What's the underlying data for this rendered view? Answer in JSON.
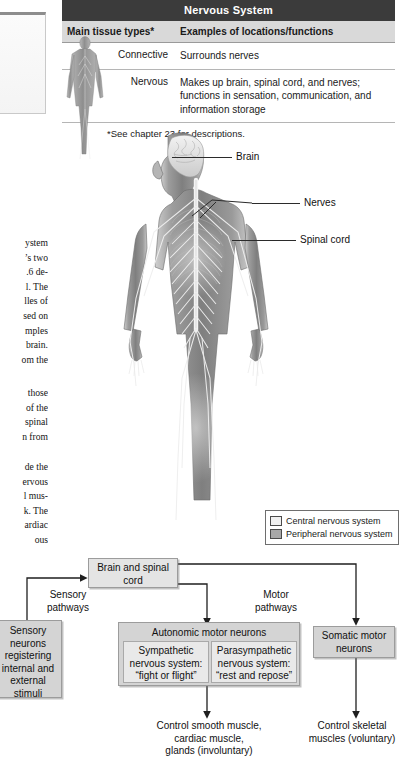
{
  "table": {
    "title": "Nervous System",
    "headers": [
      "Main tissue types*",
      "Examples of locations/functions"
    ],
    "rows": [
      {
        "tissue": "Connective",
        "examples": "Surrounds nerves"
      },
      {
        "tissue": "Nervous",
        "examples": "Makes up brain, spinal cord, and nerves; functions in sensation, communication, and information storage"
      }
    ],
    "footnote": "*See chapter 23 for descriptions."
  },
  "figure": {
    "labels": [
      {
        "text": "Brain"
      },
      {
        "text": "Nerves"
      },
      {
        "text": "Spinal cord"
      }
    ]
  },
  "legend": {
    "items": [
      {
        "label": "Central nervous system",
        "swatch": "#f0f0f0"
      },
      {
        "label": "Peripheral nervous system",
        "swatch": "#a8a8a8"
      }
    ]
  },
  "flow": {
    "brain_spinal": "Brain and\nspinal cord",
    "sensory_pathways": "Sensory\npathways",
    "motor_pathways": "Motor\npathways",
    "sensory_neurons": "Sensory\nneurons\nregistering\ninternal and\nexternal\nstimuli",
    "autonomic_title": "Autonomic motor neurons",
    "sympathetic": "Sympathetic\nnervous system:\n“fight or flight”",
    "parasympathetic": "Parasympathetic\nnervous system:\n“rest and repose”",
    "somatic": "Somatic motor\nneurons",
    "control_autonomic": "Control smooth muscle,\ncardiac muscle,\nglands (involuntary)",
    "control_somatic": "Control skeletal\nmuscles (voluntary)"
  },
  "body_text": {
    "col_a": [
      "ystem",
      "’s two",
      ".6 de-",
      "l. The",
      "lles of",
      "sed on",
      "mples",
      "brain.",
      "om the"
    ],
    "col_b": [
      "those",
      "of the",
      "spinal",
      "n from"
    ],
    "col_c": [
      "de the",
      "ervous",
      "l mus-",
      "k. The",
      "ardiac",
      "ous"
    ]
  },
  "colors": {
    "header_bar": "#3b3b3b",
    "subheader": "#d9d9d9",
    "box_fill": "#d4d4d4",
    "box_inner": "#e9e9e9"
  }
}
